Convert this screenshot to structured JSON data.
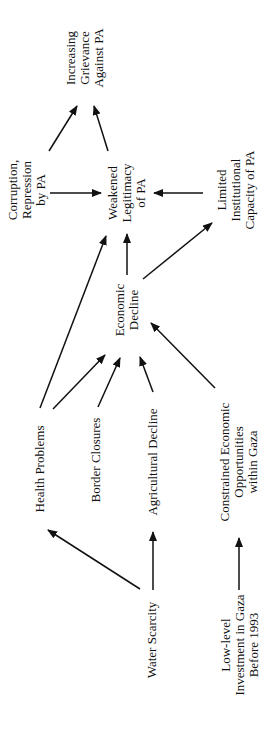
{
  "diagram": {
    "nodes": {
      "grievance": {
        "lines": [
          "Increasing",
          "Grievance",
          "Against PA"
        ]
      },
      "corruption": {
        "lines": [
          "Corruption,",
          "Repression",
          "by PA"
        ]
      },
      "legitimacy": {
        "lines": [
          "Weakened",
          "Legitimacy",
          "of PA"
        ]
      },
      "capacity": {
        "lines": [
          "Limited",
          "Institutional",
          "Capacity of PA"
        ]
      },
      "economic": {
        "lines": [
          "Economic",
          "Decline"
        ]
      },
      "health": {
        "lines": [
          "Health Problems"
        ]
      },
      "border": {
        "lines": [
          "Border Closures"
        ]
      },
      "agri": {
        "lines": [
          "Agricultural Decline"
        ]
      },
      "constrained": {
        "lines": [
          "Constrained Economic",
          "Opportunities",
          "within Gaza"
        ]
      },
      "water": {
        "lines": [
          "Water Scarcity"
        ]
      },
      "investment": {
        "lines": [
          "Low-level",
          "Investment in Gaza",
          "Before 1993"
        ]
      }
    },
    "edges": [
      {
        "from": "corruption",
        "to": "grievance"
      },
      {
        "from": "legitimacy",
        "to": "grievance"
      },
      {
        "from": "corruption",
        "to": "legitimacy"
      },
      {
        "from": "capacity",
        "to": "legitimacy"
      },
      {
        "from": "economic",
        "to": "legitimacy"
      },
      {
        "from": "health",
        "to": "legitimacy"
      },
      {
        "from": "economic",
        "to": "capacity"
      },
      {
        "from": "health",
        "to": "economic"
      },
      {
        "from": "border",
        "to": "economic"
      },
      {
        "from": "agri",
        "to": "economic"
      },
      {
        "from": "constrained",
        "to": "economic"
      },
      {
        "from": "water",
        "to": "health"
      },
      {
        "from": "water",
        "to": "agri"
      },
      {
        "from": "investment",
        "to": "constrained"
      }
    ]
  }
}
